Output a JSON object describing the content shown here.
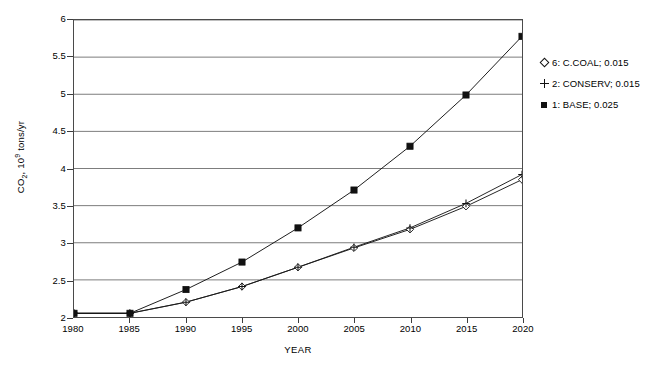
{
  "chart_data": {
    "type": "line",
    "title": "",
    "xlabel": "YEAR",
    "ylabel": "CO2, 10^9 tons/yr",
    "x": [
      1980,
      1985,
      1990,
      1995,
      2000,
      2005,
      2010,
      2015,
      2020
    ],
    "xticklabels": [
      "1980",
      "1985",
      "1990",
      "1995",
      "2000",
      "2005",
      "2010",
      "2015",
      "2020"
    ],
    "yticklabels": [
      "2",
      "2.5",
      "3",
      "3.5",
      "4",
      "4.5",
      "5",
      "5.5",
      "6"
    ],
    "yticks": [
      2,
      2.5,
      3,
      3.5,
      4,
      4.5,
      5,
      5.5,
      6
    ],
    "xlim": [
      1980,
      2020
    ],
    "ylim": [
      2,
      6
    ],
    "grid": "horizontal",
    "legend_position": "right-outside",
    "series": [
      {
        "name": "6: C.COAL; 0.015",
        "key": "ccoal",
        "marker": "open-diamond",
        "color": "#1a1a1a",
        "values": [
          2.05,
          2.05,
          2.2,
          2.41,
          2.67,
          2.93,
          3.18,
          3.49,
          3.85
        ]
      },
      {
        "name": "2: CONSERV; 0.015",
        "key": "conserv",
        "marker": "plus",
        "color": "#1a1a1a",
        "values": [
          2.05,
          2.05,
          2.2,
          2.41,
          2.67,
          2.94,
          3.2,
          3.53,
          3.92
        ]
      },
      {
        "name": "1: BASE; 0.025",
        "key": "base",
        "marker": "filled-square",
        "color": "#111111",
        "values": [
          2.05,
          2.05,
          2.37,
          2.74,
          3.2,
          3.71,
          4.3,
          4.99,
          5.78
        ]
      }
    ]
  },
  "axis": {
    "y_title_main": "CO",
    "y_title_sub": "2",
    "y_title_mid": ", 10",
    "y_title_sup": "9",
    "y_title_tail": " tons/yr",
    "x_title": "YEAR"
  },
  "legend": {
    "items": [
      {
        "label": "6: C.COAL; 0.015",
        "marker": "open-diamond"
      },
      {
        "label": "2: CONSERV; 0.015",
        "marker": "plus"
      },
      {
        "label": "1: BASE; 0.025",
        "marker": "filled-square"
      }
    ]
  }
}
